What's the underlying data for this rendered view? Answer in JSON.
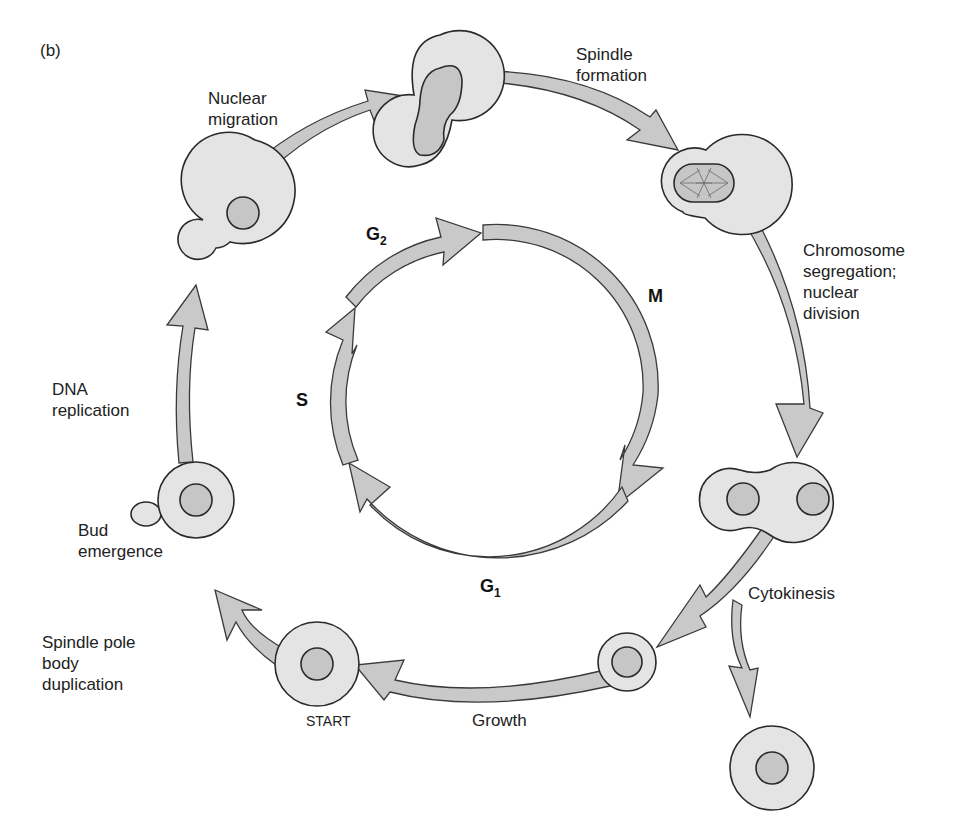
{
  "panel_label": "(b)",
  "colors": {
    "arrow_fill": "#c9c9c9",
    "cell_fill": "#e4e4e4",
    "nucleus_fill": "#c6c6c6",
    "stroke": "#333333"
  },
  "inner_cycle": {
    "phases": [
      {
        "id": "G1",
        "label": "G",
        "sub": "1"
      },
      {
        "id": "S",
        "label": "S",
        "sub": ""
      },
      {
        "id": "G2",
        "label": "G",
        "sub": "2"
      },
      {
        "id": "M",
        "label": "M",
        "sub": ""
      }
    ]
  },
  "outer_cycle": {
    "events": [
      {
        "id": "spindle-pole-body-duplication",
        "label": "Spindle pole\nbody\nduplication"
      },
      {
        "id": "start",
        "label": "START"
      },
      {
        "id": "bud-emergence",
        "label": "Bud\nemergence"
      },
      {
        "id": "dna-replication",
        "label": "DNA\nreplication"
      },
      {
        "id": "nuclear-migration",
        "label": "Nuclear\nmigration"
      },
      {
        "id": "spindle-formation",
        "label": "Spindle\nformation"
      },
      {
        "id": "chromosome-segregation",
        "label": "Chromosome\nsegregation;\nnuclear\ndivision"
      },
      {
        "id": "cytokinesis",
        "label": "Cytokinesis"
      },
      {
        "id": "growth",
        "label": "Growth"
      }
    ]
  }
}
